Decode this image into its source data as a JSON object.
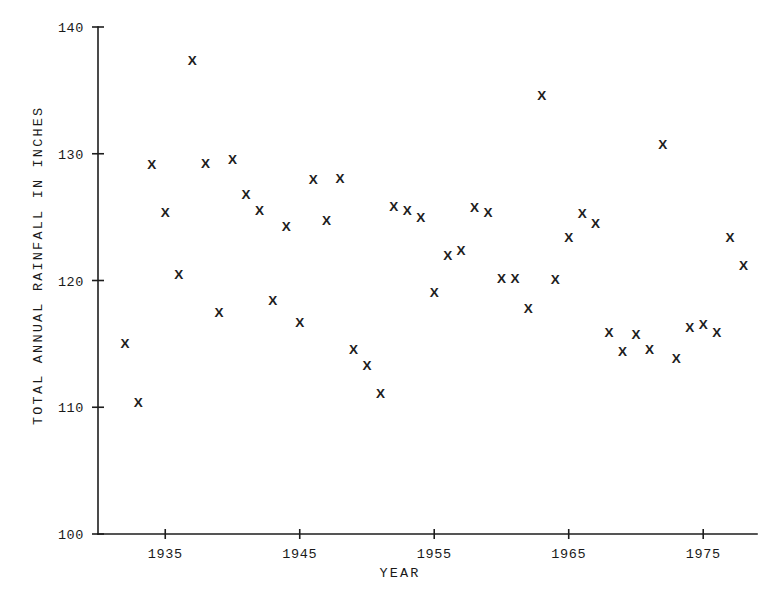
{
  "chart_data": {
    "type": "scatter",
    "title": "",
    "xlabel": "YEAR",
    "ylabel": "TOTAL ANNUAL RAINFALL IN INCHES",
    "marker": "x",
    "marker_color": "#202020",
    "grid": false,
    "legend": null,
    "xlim": [
      1930,
      1979
    ],
    "ylim": [
      100,
      140
    ],
    "xticks": [
      1935,
      1945,
      1955,
      1965,
      1975
    ],
    "xtick_labels": [
      "1935",
      "1945",
      "1955",
      "1965",
      "1975"
    ],
    "yticks": [
      100,
      110,
      120,
      130,
      140
    ],
    "ytick_labels": [
      "100",
      "110",
      "120",
      "130",
      "140"
    ],
    "x": [
      1932,
      1933,
      1934,
      1935,
      1936,
      1937,
      1938,
      1939,
      1940,
      1941,
      1942,
      1943,
      1944,
      1945,
      1946,
      1947,
      1948,
      1949,
      1950,
      1951,
      1952,
      1953,
      1954,
      1955,
      1956,
      1957,
      1958,
      1959,
      1960,
      1961,
      1962,
      1963,
      1964,
      1965,
      1966,
      1967,
      1968,
      1969,
      1970,
      1971,
      1972,
      1973,
      1974,
      1975,
      1976,
      1977,
      1978
    ],
    "y": [
      115.1,
      110.4,
      129.2,
      125.4,
      120.5,
      137.4,
      129.3,
      117.5,
      129.6,
      126.8,
      125.6,
      118.5,
      124.3,
      116.7,
      128.0,
      124.8,
      128.1,
      114.6,
      113.3,
      111.1,
      125.9,
      125.6,
      125.0,
      119.1,
      122.0,
      122.4,
      125.8,
      125.4,
      120.2,
      120.2,
      117.8,
      134.6,
      120.1,
      123.4,
      125.3,
      124.5,
      115.9,
      114.4,
      115.8,
      114.6,
      130.8,
      113.9,
      116.3,
      116.6,
      115.9,
      123.4,
      121.2
    ],
    "points": [
      {
        "year": 1932,
        "rainfall": 115.1
      },
      {
        "year": 1933,
        "rainfall": 110.4
      },
      {
        "year": 1934,
        "rainfall": 129.2
      },
      {
        "year": 1935,
        "rainfall": 125.4
      },
      {
        "year": 1936,
        "rainfall": 120.5
      },
      {
        "year": 1937,
        "rainfall": 137.4
      },
      {
        "year": 1938,
        "rainfall": 129.3
      },
      {
        "year": 1939,
        "rainfall": 117.5
      },
      {
        "year": 1940,
        "rainfall": 129.6
      },
      {
        "year": 1941,
        "rainfall": 126.8
      },
      {
        "year": 1942,
        "rainfall": 125.6
      },
      {
        "year": 1943,
        "rainfall": 118.5
      },
      {
        "year": 1944,
        "rainfall": 124.3
      },
      {
        "year": 1945,
        "rainfall": 116.7
      },
      {
        "year": 1946,
        "rainfall": 128.0
      },
      {
        "year": 1947,
        "rainfall": 124.8
      },
      {
        "year": 1948,
        "rainfall": 128.1
      },
      {
        "year": 1949,
        "rainfall": 114.6
      },
      {
        "year": 1950,
        "rainfall": 113.3
      },
      {
        "year": 1951,
        "rainfall": 111.1
      },
      {
        "year": 1952,
        "rainfall": 125.9
      },
      {
        "year": 1953,
        "rainfall": 125.6
      },
      {
        "year": 1954,
        "rainfall": 125.0
      },
      {
        "year": 1955,
        "rainfall": 119.1
      },
      {
        "year": 1956,
        "rainfall": 122.0
      },
      {
        "year": 1957,
        "rainfall": 122.4
      },
      {
        "year": 1958,
        "rainfall": 125.8
      },
      {
        "year": 1959,
        "rainfall": 125.4
      },
      {
        "year": 1960,
        "rainfall": 120.2
      },
      {
        "year": 1961,
        "rainfall": 120.2
      },
      {
        "year": 1962,
        "rainfall": 117.8
      },
      {
        "year": 1963,
        "rainfall": 134.6
      },
      {
        "year": 1964,
        "rainfall": 120.1
      },
      {
        "year": 1965,
        "rainfall": 123.4
      },
      {
        "year": 1966,
        "rainfall": 125.3
      },
      {
        "year": 1967,
        "rainfall": 124.5
      },
      {
        "year": 1968,
        "rainfall": 115.9
      },
      {
        "year": 1969,
        "rainfall": 114.4
      },
      {
        "year": 1970,
        "rainfall": 115.8
      },
      {
        "year": 1971,
        "rainfall": 114.6
      },
      {
        "year": 1972,
        "rainfall": 130.8
      },
      {
        "year": 1973,
        "rainfall": 113.9
      },
      {
        "year": 1974,
        "rainfall": 116.3
      },
      {
        "year": 1975,
        "rainfall": 116.6
      },
      {
        "year": 1976,
        "rainfall": 115.9
      },
      {
        "year": 1977,
        "rainfall": 123.4
      },
      {
        "year": 1978,
        "rainfall": 121.2
      }
    ]
  },
  "axes": {
    "y_axis_title": "TOTAL ANNUAL RAINFALL IN INCHES",
    "x_axis_title": "YEAR"
  }
}
